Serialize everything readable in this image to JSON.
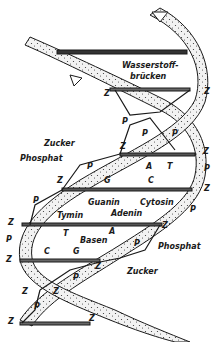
{
  "diagram": {
    "type": "DNA double helix",
    "colors": {
      "ink": "#1a1a1a",
      "strand_fill": "#e6e6e6",
      "background": "#ffffff"
    },
    "labels": {
      "hydrogen_bonds_1": "Wasserstoff-",
      "hydrogen_bonds_2": "brücken",
      "sugar_top": "Zucker",
      "phosphate_top": "Phosphat",
      "guanine": "Guanin",
      "cytosine": "Cytosin",
      "thymine": "Tymin",
      "adenine": "Adenin",
      "bases": "Basen",
      "phosphate_bottom": "Phosphat",
      "sugar_bottom": "Zucker"
    },
    "letters": {
      "Z": "Z",
      "P": "P",
      "A": "A",
      "T": "T",
      "G": "G",
      "C": "C"
    }
  }
}
